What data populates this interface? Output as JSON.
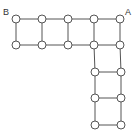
{
  "diagram": {
    "type": "graph",
    "colors": {
      "edge": "#555555",
      "node_fill": "#ffffff",
      "node_stroke": "#555555",
      "label": "#333333"
    },
    "labels": [
      {
        "id": "B",
        "text": "B",
        "x": 3,
        "y": 8
      },
      {
        "id": "A",
        "text": "A",
        "x": 125,
        "y": 8
      }
    ],
    "nodes": [
      {
        "id": "r0c0",
        "x": 16,
        "y": 19
      },
      {
        "id": "r0c1",
        "x": 42,
        "y": 19
      },
      {
        "id": "r0c2",
        "x": 68,
        "y": 19
      },
      {
        "id": "r0c3",
        "x": 94,
        "y": 19
      },
      {
        "id": "r0c4",
        "x": 120,
        "y": 19
      },
      {
        "id": "r1c0",
        "x": 16,
        "y": 45
      },
      {
        "id": "r1c1",
        "x": 42,
        "y": 45
      },
      {
        "id": "r1c2",
        "x": 68,
        "y": 45
      },
      {
        "id": "r1c3",
        "x": 94,
        "y": 45
      },
      {
        "id": "r1c4",
        "x": 120,
        "y": 45
      },
      {
        "id": "r2c3",
        "x": 95,
        "y": 72
      },
      {
        "id": "r2c4",
        "x": 121,
        "y": 72
      },
      {
        "id": "r3c3",
        "x": 95,
        "y": 98
      },
      {
        "id": "r3c4",
        "x": 121,
        "y": 98
      },
      {
        "id": "r4c3",
        "x": 95,
        "y": 125
      },
      {
        "id": "r4c4",
        "x": 121,
        "y": 125
      }
    ],
    "edges": [
      [
        "r0c0",
        "r0c1"
      ],
      [
        "r0c1",
        "r0c2"
      ],
      [
        "r0c2",
        "r0c3"
      ],
      [
        "r0c3",
        "r0c4"
      ],
      [
        "r1c0",
        "r1c1"
      ],
      [
        "r1c1",
        "r1c2"
      ],
      [
        "r1c2",
        "r1c3"
      ],
      [
        "r1c3",
        "r1c4"
      ],
      [
        "r0c0",
        "r1c0"
      ],
      [
        "r0c1",
        "r1c1"
      ],
      [
        "r0c2",
        "r1c2"
      ],
      [
        "r0c3",
        "r1c3"
      ],
      [
        "r0c4",
        "r1c4"
      ],
      [
        "r1c3",
        "r2c3"
      ],
      [
        "r1c4",
        "r2c4"
      ],
      [
        "r2c3",
        "r2c4"
      ],
      [
        "r2c3",
        "r3c3"
      ],
      [
        "r2c4",
        "r3c4"
      ],
      [
        "r3c3",
        "r3c4"
      ],
      [
        "r3c3",
        "r4c3"
      ],
      [
        "r3c4",
        "r4c4"
      ],
      [
        "r4c3",
        "r4c4"
      ]
    ],
    "node_radius": 4
  }
}
